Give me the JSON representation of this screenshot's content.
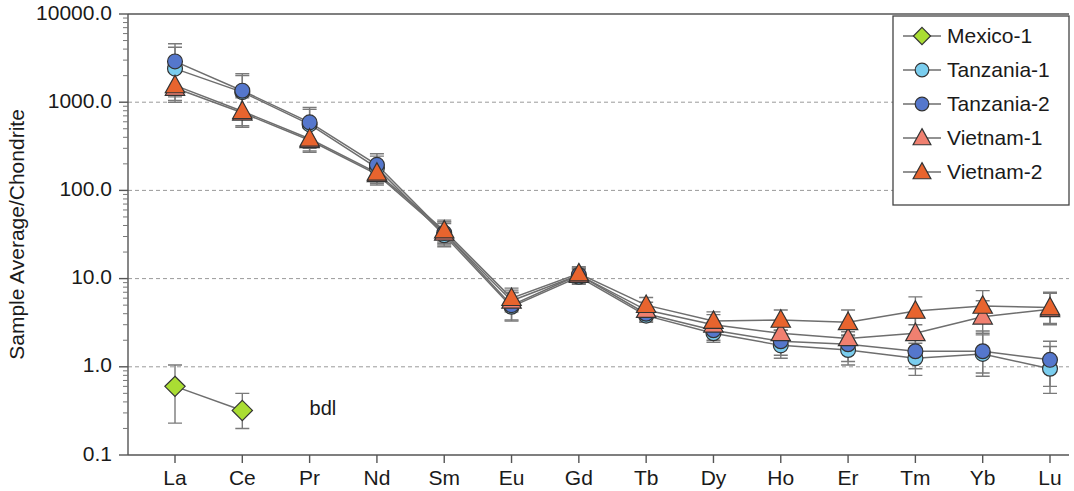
{
  "chart_data": {
    "type": "line",
    "title": "",
    "xlabel": "",
    "ylabel": "Sample Average/Chondrite",
    "y_scale": "log",
    "ylim": [
      0.1,
      10000.0
    ],
    "ytick_labels": [
      "10000.0",
      "1000.0",
      "100.0",
      "10.0",
      "1.0",
      "0.1"
    ],
    "ytick_values": [
      10000.0,
      1000.0,
      100.0,
      10.0,
      1.0,
      0.1
    ],
    "grid": "horizontal-dashed",
    "legend_position": "top-right",
    "categories": [
      "La",
      "Ce",
      "Pr",
      "Nd",
      "Sm",
      "Eu",
      "Gd",
      "Tb",
      "Dy",
      "Ho",
      "Er",
      "Tm",
      "Yb",
      "Lu"
    ],
    "annotations": [
      {
        "text": "bdl",
        "x_category": "Pr",
        "y_value": 0.33
      }
    ],
    "series": [
      {
        "name": "Mexico-1",
        "color": "#AADD33",
        "marker": "diamond",
        "values": [
          0.6,
          0.32,
          null,
          null,
          null,
          null,
          null,
          null,
          null,
          null,
          null,
          null,
          null,
          null
        ],
        "err_low": [
          0.23,
          0.2,
          null,
          null,
          null,
          null,
          null,
          null,
          null,
          null,
          null,
          null,
          null,
          null
        ],
        "err_high": [
          1.05,
          0.5,
          null,
          null,
          null,
          null,
          null,
          null,
          null,
          null,
          null,
          null,
          null,
          null
        ]
      },
      {
        "name": "Tanzania-1",
        "color": "#7ACDEE",
        "marker": "circle",
        "values": [
          2400,
          1300,
          560,
          180,
          31,
          4.8,
          10.5,
          3.8,
          2.4,
          1.75,
          1.55,
          1.25,
          1.4,
          0.95
        ],
        "err_low": [
          1150,
          700,
          300,
          125,
          23,
          3.3,
          8.6,
          3.2,
          1.9,
          1.25,
          1.05,
          0.8,
          0.78,
          0.5
        ],
        "err_high": [
          4200,
          2000,
          830,
          245,
          42,
          6.9,
          12.6,
          4.6,
          3.0,
          2.35,
          2.25,
          1.85,
          2.3,
          1.7
        ]
      },
      {
        "name": "Tanzania-2",
        "color": "#5577CC",
        "marker": "circle",
        "values": [
          2900,
          1350,
          590,
          195,
          33,
          5.0,
          11.0,
          4.0,
          2.6,
          1.95,
          1.8,
          1.5,
          1.5,
          1.2
        ],
        "err_low": [
          1200,
          720,
          310,
          130,
          24,
          3.4,
          8.8,
          3.3,
          2.0,
          1.35,
          1.15,
          0.95,
          0.85,
          0.6
        ],
        "err_high": [
          4600,
          2100,
          870,
          260,
          44,
          7.0,
          13.0,
          4.8,
          3.2,
          2.6,
          2.5,
          2.2,
          2.55,
          1.95
        ]
      },
      {
        "name": "Vietnam-1",
        "color": "#F08070",
        "marker": "triangle",
        "values": [
          1450,
          760,
          370,
          152,
          33,
          5.6,
          11.0,
          4.4,
          3.0,
          2.4,
          2.1,
          2.4,
          3.7,
          4.5
        ],
        "err_low": [
          1000,
          520,
          270,
          115,
          25,
          4.2,
          9.0,
          3.6,
          2.3,
          1.8,
          1.5,
          1.6,
          2.4,
          3.0
        ],
        "err_high": [
          2200,
          1120,
          510,
          200,
          44,
          7.4,
          13.2,
          5.4,
          3.9,
          3.2,
          3.0,
          3.6,
          5.6,
          6.8
        ]
      },
      {
        "name": "Vietnam-2",
        "color": "#E8642E",
        "marker": "triangle",
        "values": [
          1550,
          790,
          385,
          158,
          35,
          6.0,
          11.4,
          5.0,
          3.3,
          3.4,
          3.2,
          4.3,
          4.9,
          4.7
        ],
        "err_low": [
          1050,
          540,
          280,
          120,
          26,
          4.4,
          9.2,
          4.0,
          2.6,
          2.6,
          2.3,
          3.0,
          3.3,
          3.1
        ],
        "err_high": [
          2300,
          1160,
          530,
          208,
          46,
          7.8,
          13.6,
          6.1,
          4.2,
          4.4,
          4.4,
          6.2,
          7.3,
          7.0
        ]
      }
    ]
  },
  "legend": {
    "items": [
      {
        "label": "Mexico-1"
      },
      {
        "label": "Tanzania-1"
      },
      {
        "label": "Tanzania-2"
      },
      {
        "label": "Vietnam-1"
      },
      {
        "label": "Vietnam-2"
      }
    ]
  }
}
